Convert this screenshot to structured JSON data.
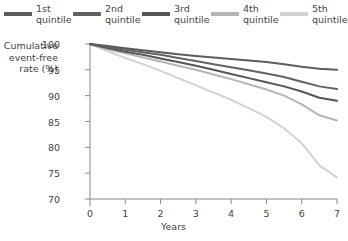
{
  "chart_data": {
    "type": "line",
    "title": "",
    "xlabel": "Years",
    "ylabel": "Cumulative\nevent-free\nrate (%)",
    "xlim": [
      0,
      7
    ],
    "ylim": [
      70,
      100
    ],
    "xticks": [
      "0",
      "1",
      "2",
      "3",
      "4",
      "5",
      "6",
      "7"
    ],
    "yticks": [
      "70",
      "75",
      "80",
      "85",
      "90",
      "95",
      "100"
    ],
    "grid": false,
    "legend_position": "top",
    "x": [
      0,
      0.5,
      1,
      1.5,
      2,
      2.5,
      3,
      3.5,
      4,
      4.5,
      5,
      5.5,
      6,
      6.5,
      7
    ],
    "series": [
      {
        "name": "1st\nquintile",
        "label_line1": "1st",
        "label_line2": "quintile",
        "color": "#5c5c5c",
        "values": [
          100,
          99.6,
          99.2,
          98.8,
          98.4,
          98.0,
          97.7,
          97.4,
          97.1,
          96.8,
          96.5,
          96.1,
          95.6,
          95.2,
          95.0
        ]
      },
      {
        "name": "2nd\nquintile",
        "label_line1": "2nd",
        "label_line2": "quintile",
        "color": "#626262",
        "values": [
          100,
          99.4,
          98.9,
          98.4,
          97.9,
          97.3,
          96.7,
          96.1,
          95.5,
          94.9,
          94.3,
          93.6,
          92.7,
          91.8,
          91.3
        ]
      },
      {
        "name": "3rd\nquintile",
        "label_line1": "3rd",
        "label_line2": "quintile",
        "color": "#555555",
        "values": [
          100,
          99.2,
          98.5,
          97.9,
          97.2,
          96.5,
          95.8,
          95.0,
          94.2,
          93.4,
          92.6,
          91.8,
          90.8,
          89.6,
          89.0
        ]
      },
      {
        "name": "4th\nquintile",
        "label_line1": "4th",
        "label_line2": "quintile",
        "color": "#b5b5b5",
        "values": [
          100,
          99.0,
          98.2,
          97.4,
          96.6,
          95.8,
          95.0,
          94.1,
          93.2,
          92.2,
          91.2,
          90.0,
          88.3,
          86.2,
          85.2
        ]
      },
      {
        "name": "5th\nquintile",
        "label_line1": "5th",
        "label_line2": "quintile",
        "color": "#d2d2d2",
        "values": [
          100,
          98.6,
          97.3,
          96.1,
          94.8,
          93.4,
          92.0,
          90.6,
          89.2,
          87.6,
          85.9,
          83.7,
          80.8,
          76.5,
          74.2
        ]
      }
    ]
  },
  "axis": {
    "line_color": "#8a8a8a"
  }
}
